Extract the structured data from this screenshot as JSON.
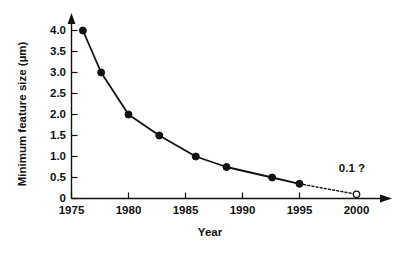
{
  "chart_data": {
    "type": "line",
    "title": "",
    "subtitle": "",
    "xlabel": "Year",
    "ylabel": "Minimum feature size  (µm)",
    "xlim": [
      1975,
      2001.5
    ],
    "ylim": [
      0,
      4.35
    ],
    "grid": false,
    "legend": "none",
    "xticks": [
      1975,
      1980,
      1985,
      1990,
      1995,
      2000
    ],
    "xticklabels": [
      "1975",
      "1980",
      "1985",
      "1990",
      "1995",
      "2000"
    ],
    "yticks": [
      0,
      0.5,
      1.0,
      1.5,
      2.0,
      2.5,
      3.0,
      3.5,
      4.0
    ],
    "yticklabels": [
      "0",
      "0.5",
      "1.0",
      "1.5",
      "2.0",
      "2.5",
      "3.0",
      "3.5",
      "4.0"
    ],
    "series": [
      {
        "name": "Minimum feature size",
        "marker": "filled-circle",
        "linestyle": "solid",
        "x": [
          1976.0,
          1977.6,
          1980.0,
          1982.7,
          1985.9,
          1988.6,
          1992.6,
          1995.0
        ],
        "values": [
          4.0,
          3.0,
          2.0,
          1.5,
          1.0,
          0.75,
          0.5,
          0.35
        ]
      },
      {
        "name": "Projection",
        "marker": "open-circle",
        "linestyle": "dotted",
        "x": [
          1995.0,
          2000.0
        ],
        "values": [
          0.35,
          0.1
        ]
      }
    ],
    "annotations": [
      {
        "text": "0.1 ?",
        "x": 2000.0,
        "y": 0.1,
        "label_x": 1999.6,
        "label_y": 0.62
      }
    ]
  },
  "axes": {
    "y_axis_label": "Minimum feature size  (µm)",
    "x_axis_label": "Year"
  }
}
